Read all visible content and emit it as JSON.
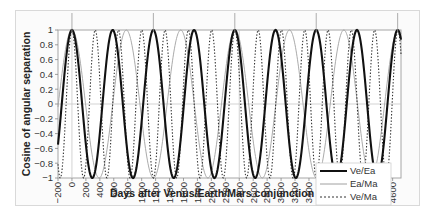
{
  "chart_data": {
    "type": "line",
    "title": "",
    "xlabel": "Days after Venus/Earth/Mars conjunction",
    "ylabel": "Cosine of angular separation",
    "xlim": [
      -200,
      4720
    ],
    "ylim": [
      -1,
      1
    ],
    "x_ticks": [
      -200,
      0,
      200,
      400,
      600,
      800,
      1000,
      1200,
      1400,
      1600,
      1800,
      2000,
      2200,
      2400,
      2600,
      2800,
      3000,
      3200,
      3400,
      3600,
      3800,
      4000,
      4200,
      4400,
      4600
    ],
    "y_ticks": [
      1,
      0.8,
      0.6,
      0.4,
      0.2,
      0,
      -0.2,
      -0.4,
      -0.6,
      -0.8,
      -1
    ],
    "y_tick_labels": [
      "1",
      "0.8",
      "0.6",
      "0.4",
      "0.2",
      "0",
      "−0.2",
      "−0.4",
      "−0.6",
      "−0.8",
      "−1"
    ],
    "grid": {
      "horizontal_at": [
        0
      ],
      "vertical_at": [
        0,
        2400
      ]
    },
    "legend_position": "bottom-right",
    "series": [
      {
        "name": "Ve/Ea",
        "function": "cos(2*pi*t/period)",
        "period_days": 584,
        "phase_days": 0,
        "style": "solid-thick",
        "color": "#111111"
      },
      {
        "name": "Ea/Ma",
        "function": "cos(2*pi*t/period)",
        "period_days": 780,
        "phase_days": 0,
        "style": "solid-thin",
        "color": "#a0a0a0"
      },
      {
        "name": "Ve/Ma",
        "function": "cos(2*pi*t/period)",
        "period_days": 334,
        "phase_days": 0,
        "style": "dotted",
        "color": "#333333"
      }
    ],
    "sample_points": {
      "x": [
        -200,
        0,
        292,
        584,
        876,
        1168,
        1752,
        2336,
        2920,
        3504,
        4088,
        4672
      ],
      "Ve/Ea": [
        0.48,
        1,
        -1,
        1,
        -1,
        1,
        1,
        1,
        1,
        1,
        1,
        1
      ],
      "Ea/Ma": [
        0.15,
        1,
        -0.72,
        -0.31,
        0.15,
        -0.6,
        -0.81,
        0.34,
        -0.23,
        0.99,
        -0.55,
        -0.57
      ],
      "Ve/Ma": [
        -0.84,
        1,
        -0.67,
        -0.06,
        0.91,
        0.22,
        0.83,
        0.02,
        0.84,
        0.35,
        0.05,
        0.84
      ]
    },
    "top_marker_days": [
      0,
      1168,
      2336,
      3504,
      4672
    ]
  },
  "legend": {
    "items": [
      {
        "label": "Ve/Ea"
      },
      {
        "label": "Ea/Ma"
      },
      {
        "label": "Ve/Ma"
      }
    ]
  }
}
